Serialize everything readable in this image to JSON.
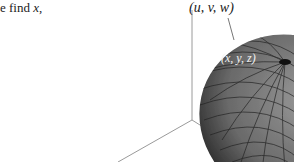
{
  "text": {
    "prefix": "e find ",
    "variable": "x",
    "suffix": ","
  },
  "figure": {
    "point_outer_label": "(u, v, w)",
    "point_surface_label": "(x, y, z)",
    "surface": "ellipsoid",
    "axes_color": "#9a9a9a",
    "surface_fill": "#6e6e6e",
    "grid_color": "#222222"
  }
}
